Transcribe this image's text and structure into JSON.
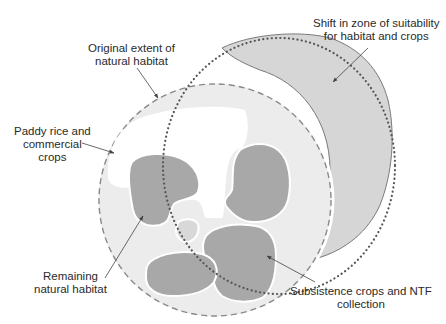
{
  "labels": {
    "original_extent": [
      "Original extent of",
      "natural habitat"
    ],
    "paddy_rice": [
      "Paddy rice and",
      "commercial",
      "crops"
    ],
    "shift_zone": [
      "Shift in zone of suitability",
      "for habitat and crops"
    ],
    "remaining_habitat": [
      "Remaining",
      "natural habitat"
    ],
    "subsistence": [
      "Subsistence crops and NTF",
      "collection"
    ]
  },
  "colors": {
    "background": "#ffffff",
    "light_zone": "#ececec",
    "dark_patch": "#a8a8a8",
    "shifted_zone": "#d6d6d6",
    "outline": "#7a7a7a",
    "dotted": "#555555",
    "text": "#2a2a2a"
  }
}
